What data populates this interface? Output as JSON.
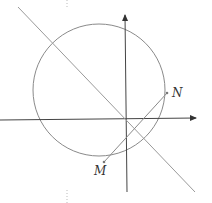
{
  "diagram": {
    "type": "coordinate-geometry",
    "points": [
      {
        "name": "N",
        "label": "N"
      },
      {
        "name": "M",
        "label": "M"
      }
    ],
    "elements": [
      "x-axis",
      "y-axis",
      "circle",
      "line",
      "segment MN"
    ],
    "colors": {
      "axis": "#444444",
      "curve": "#888888",
      "text": "#333333"
    }
  }
}
